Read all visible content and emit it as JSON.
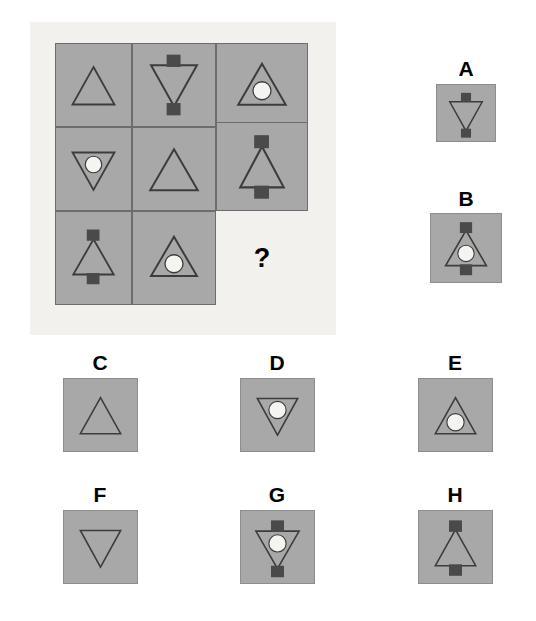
{
  "puzzle": {
    "type": "visual-analogy-matrix",
    "question_mark": "?",
    "colors": {
      "page_background": "#ffffff",
      "panel_background": "#f2f1ee",
      "cell_fill": "#a8a8a8",
      "cell_border": "#6d6d6d",
      "shape_stroke": "#3c3c3c",
      "square_fill": "#4a4a4a",
      "circle_fill": "#f4f4f0",
      "label_color": "#000000"
    },
    "matrix": {
      "rows": 3,
      "columns": 3,
      "cells": [
        {
          "id": "cell-1-1",
          "row": 1,
          "col": 1,
          "triangle": "up",
          "circle": false,
          "squares": "none"
        },
        {
          "id": "cell-1-2",
          "row": 1,
          "col": 2,
          "triangle": "down",
          "circle": false,
          "squares": "both"
        },
        {
          "id": "cell-1-3",
          "row": 1,
          "col": 3,
          "triangle": "up",
          "circle": true,
          "squares": "none"
        },
        {
          "id": "cell-2-1",
          "row": 2,
          "col": 1,
          "triangle": "down",
          "circle": true,
          "squares": "none"
        },
        {
          "id": "cell-2-2",
          "row": 2,
          "col": 2,
          "triangle": "up",
          "circle": false,
          "squares": "none"
        },
        {
          "id": "cell-2-3",
          "row": 2,
          "col": 3,
          "triangle": "up",
          "circle": false,
          "squares": "both"
        },
        {
          "id": "cell-3-1",
          "row": 3,
          "col": 1,
          "triangle": "up",
          "circle": false,
          "squares": "both"
        },
        {
          "id": "cell-3-2",
          "row": 3,
          "col": 2,
          "triangle": "up",
          "circle": true,
          "squares": "none"
        },
        {
          "id": "cell-3-3",
          "row": 3,
          "col": 3,
          "triangle": "none",
          "circle": false,
          "squares": "none",
          "missing": true
        }
      ]
    },
    "options": [
      {
        "label": "A",
        "triangle": "down",
        "circle": false,
        "squares": "both"
      },
      {
        "label": "B",
        "triangle": "up",
        "circle": true,
        "squares": "both"
      },
      {
        "label": "C",
        "triangle": "up",
        "circle": false,
        "squares": "none"
      },
      {
        "label": "D",
        "triangle": "down",
        "circle": true,
        "squares": "none"
      },
      {
        "label": "E",
        "triangle": "up",
        "circle": true,
        "squares": "none"
      },
      {
        "label": "F",
        "triangle": "down",
        "circle": false,
        "squares": "none"
      },
      {
        "label": "G",
        "triangle": "down",
        "circle": true,
        "squares": "both"
      },
      {
        "label": "H",
        "triangle": "up",
        "circle": false,
        "squares": "both"
      }
    ]
  }
}
